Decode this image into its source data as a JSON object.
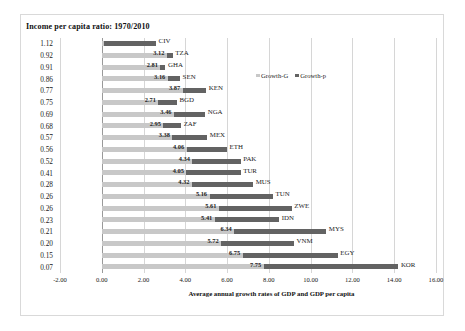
{
  "chart_data": {
    "type": "bar",
    "orientation": "horizontal",
    "title": "Income per capita ratio: 1970/2010",
    "xlabel": "Average annual growth rates of GDP and GDP per capita",
    "ylabel": "",
    "xlim": [
      -2.0,
      16.0
    ],
    "xticks": [
      "-2.00",
      "0.00",
      "2.00",
      "4.00",
      "6.00",
      "8.00",
      "10.00",
      "12.00",
      "14.00",
      "16.00"
    ],
    "xtick_values": [
      -2,
      0,
      2,
      4,
      6,
      8,
      10,
      12,
      14,
      16
    ],
    "grid": true,
    "legend_position": "inside-upper-right",
    "legend": [
      "Growth-G",
      "Growth-p"
    ],
    "categories": [
      "1.12",
      "0.92",
      "0.91",
      "0.86",
      "0.77",
      "0.75",
      "0.69",
      "0.68",
      "0.57",
      "0.56",
      "0.52",
      "0.41",
      "0.28",
      "0.26",
      "0.26",
      "0.23",
      "0.21",
      "0.20",
      "0.15",
      "0.07"
    ],
    "country_codes": [
      "CIV",
      "TZA",
      "GHA",
      "SEN",
      "KEN",
      "BGD",
      "NGA",
      "ZAF",
      "MEX",
      "ETH",
      "PAK",
      "TUR",
      "MUS",
      "TUN",
      "ZWE",
      "IDN",
      "MYS",
      "VNM",
      "EGY",
      "KOR"
    ],
    "series": [
      {
        "name": "Growth-G",
        "color": "#c8c8c8",
        "values": [
          2.55,
          3.12,
          2.81,
          3.16,
          3.87,
          2.71,
          3.46,
          2.95,
          3.38,
          4.06,
          4.34,
          4.05,
          4.32,
          5.16,
          5.61,
          5.41,
          6.34,
          5.72,
          6.75,
          7.75
        ],
        "labels": [
          "",
          "3.12",
          "2.81",
          "3.16",
          "3.87",
          "2.71",
          "3.46",
          "2.95",
          "3.38",
          "4.06",
          "4.34",
          "4.05",
          "4.32",
          "5.16",
          "5.61",
          "5.41",
          "6.34",
          "5.72",
          "6.75",
          "7.75"
        ]
      },
      {
        "name": "Growth-p",
        "color": "#636363",
        "values": [
          -0.15,
          0.25,
          0.22,
          0.55,
          1.12,
          0.9,
          1.45,
          0.82,
          1.65,
          1.95,
          2.32,
          2.6,
          2.9,
          3.05,
          3.5,
          3.1,
          4.4,
          3.5,
          4.5,
          6.45
        ],
        "cumulative_end": [
          2.6,
          3.4,
          3.05,
          3.75,
          5.0,
          3.6,
          4.95,
          3.8,
          5.05,
          6.0,
          6.65,
          6.65,
          7.25,
          8.2,
          9.1,
          8.5,
          10.75,
          9.2,
          11.3,
          14.2
        ]
      }
    ],
    "rows": [
      {
        "ratio": "1.12",
        "code": "CIV",
        "growth_g_label": "",
        "growth_g": 2.55,
        "growth_p_end": 2.6,
        "dark_start": 0.1
      },
      {
        "ratio": "0.92",
        "code": "TZA",
        "growth_g_label": "3.12",
        "growth_g": 3.12,
        "growth_p_end": 3.4,
        "dark_start": 3.12
      },
      {
        "ratio": "0.91",
        "code": "GHA",
        "growth_g_label": "2.81",
        "growth_g": 2.81,
        "growth_p_end": 3.05,
        "dark_start": 2.81
      },
      {
        "ratio": "0.86",
        "code": "SEN",
        "growth_g_label": "3.16",
        "growth_g": 3.16,
        "growth_p_end": 3.75,
        "dark_start": 3.16
      },
      {
        "ratio": "0.77",
        "code": "KEN",
        "growth_g_label": "3.87",
        "growth_g": 3.87,
        "growth_p_end": 5.0,
        "dark_start": 3.87
      },
      {
        "ratio": "0.75",
        "code": "BGD",
        "growth_g_label": "2.71",
        "growth_g": 2.71,
        "growth_p_end": 3.6,
        "dark_start": 2.71
      },
      {
        "ratio": "0.69",
        "code": "NGA",
        "growth_g_label": "3.46",
        "growth_g": 3.46,
        "growth_p_end": 4.95,
        "dark_start": 3.46
      },
      {
        "ratio": "0.68",
        "code": "ZAF",
        "growth_g_label": "2.95",
        "growth_g": 2.95,
        "growth_p_end": 3.8,
        "dark_start": 2.95
      },
      {
        "ratio": "0.57",
        "code": "MEX",
        "growth_g_label": "3.38",
        "growth_g": 3.38,
        "growth_p_end": 5.05,
        "dark_start": 3.38
      },
      {
        "ratio": "0.56",
        "code": "ETH",
        "growth_g_label": "4.06",
        "growth_g": 4.06,
        "growth_p_end": 6.0,
        "dark_start": 4.06
      },
      {
        "ratio": "0.52",
        "code": "PAK",
        "growth_g_label": "4.34",
        "growth_g": 4.34,
        "growth_p_end": 6.65,
        "dark_start": 4.34
      },
      {
        "ratio": "0.41",
        "code": "TUR",
        "growth_g_label": "4.05",
        "growth_g": 4.05,
        "growth_p_end": 6.65,
        "dark_start": 4.05
      },
      {
        "ratio": "0.28",
        "code": "MUS",
        "growth_g_label": "4.32",
        "growth_g": 4.32,
        "growth_p_end": 7.25,
        "dark_start": 4.32
      },
      {
        "ratio": "0.26",
        "code": "TUN",
        "growth_g_label": "5.16",
        "growth_g": 5.16,
        "growth_p_end": 8.2,
        "dark_start": 5.16
      },
      {
        "ratio": "0.26",
        "code": "ZWE",
        "growth_g_label": "5.61",
        "growth_g": 5.61,
        "growth_p_end": 9.1,
        "dark_start": 5.61
      },
      {
        "ratio": "0.23",
        "code": "IDN",
        "growth_g_label": "5.41",
        "growth_g": 5.41,
        "growth_p_end": 8.5,
        "dark_start": 5.41
      },
      {
        "ratio": "0.21",
        "code": "MYS",
        "growth_g_label": "6.34",
        "growth_g": 6.34,
        "growth_p_end": 10.75,
        "dark_start": 6.34
      },
      {
        "ratio": "0.20",
        "code": "VNM",
        "growth_g_label": "5.72",
        "growth_g": 5.72,
        "growth_p_end": 9.2,
        "dark_start": 5.72
      },
      {
        "ratio": "0.15",
        "code": "EGY",
        "growth_g_label": "6.75",
        "growth_g": 6.75,
        "growth_p_end": 11.3,
        "dark_start": 6.75
      },
      {
        "ratio": "0.07",
        "code": "KOR",
        "growth_g_label": "7.75",
        "growth_g": 7.75,
        "growth_p_end": 14.2,
        "dark_start": 7.75
      }
    ]
  }
}
